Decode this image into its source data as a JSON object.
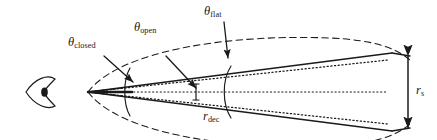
{
  "figure": {
    "name": "relativistic-jet-geometry-diagram",
    "background": "#ffffff",
    "stroke_color": "#1a1a1a",
    "width": 437,
    "height": 140
  },
  "observer": {
    "icon": "eye-icon",
    "description": "observer eye symbol at left of jet apex"
  },
  "labels": {
    "theta_closed": {
      "symbol": "θ",
      "subscript": "closed"
    },
    "theta_open": {
      "symbol": "θ",
      "subscript": "open"
    },
    "theta_flat": {
      "symbol": "θ",
      "subscript": "flat"
    },
    "r_dec": {
      "symbol": "r",
      "subscript": "dec"
    },
    "r_s": {
      "symbol": "r",
      "subscript": "s"
    }
  },
  "geometry": {
    "apex": {
      "x": 88,
      "y": 92
    },
    "jet_end_x": 392,
    "r_s_arrow": {
      "x": 408,
      "y_top": 52,
      "y_bottom": 132
    },
    "boundaries": [
      {
        "name": "closed-boundary-dashed",
        "style": "dashed"
      },
      {
        "name": "open-boundary-solid",
        "style": "solid"
      },
      {
        "name": "flat-boundary-dotted",
        "style": "dotted"
      }
    ],
    "arcs": [
      {
        "name": "theta-closed-arc",
        "x": 128
      },
      {
        "name": "theta-flat-arc",
        "x": 228
      }
    ],
    "tick": {
      "name": "r-dec-tick",
      "x": 196,
      "y": 92
    }
  }
}
